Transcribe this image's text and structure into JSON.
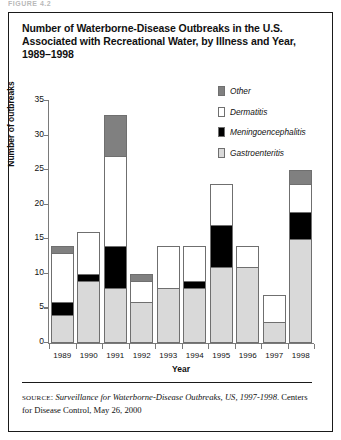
{
  "scan_header": "FIGURE 4.2",
  "figure": {
    "title": "Number of Waterborne-Disease Outbreaks in the U.S. Associated with Recreational Water, by Illness and Year, 1989–1998",
    "source_keyword": "SOURCE",
    "source_italic": "Surveillance for Waterborne-Disease Outbreaks, US, 1997-1998",
    "source_rest": ". Centers for Disease Control, May 26, 2000"
  },
  "colors": {
    "other": "#808080",
    "dermatitis": "#ffffff",
    "meningoencephalitis": "#000000",
    "gastroenteritis": "#d9d9d9",
    "outline": "#6f6f6f",
    "axis": "#7a7a7a",
    "text": "#111111",
    "frame": "#1a1a1a"
  },
  "chart_data": {
    "type": "bar",
    "stacked": true,
    "title": "Number of Waterborne-Disease Outbreaks in the U.S. Associated with Recreational Water, by Illness and Year, 1989–1998",
    "xlabel": "Year",
    "ylabel": "Number of outbreaks",
    "ylim": [
      0,
      35
    ],
    "yticks": [
      0,
      5,
      10,
      15,
      20,
      25,
      30,
      35
    ],
    "grid": false,
    "legend_position": "top-right",
    "categories": [
      "1989",
      "1990",
      "1991",
      "1992",
      "1993",
      "1994",
      "1995",
      "1996",
      "1997",
      "1998"
    ],
    "series": [
      {
        "name": "Gastroenteritis",
        "color": "#d9d9d9",
        "values": [
          4,
          9,
          8,
          6,
          8,
          8,
          11,
          11,
          3,
          15
        ]
      },
      {
        "name": "Meningoencephalitis",
        "color": "#000000",
        "values": [
          2,
          1,
          6,
          0,
          0,
          1,
          6,
          0,
          0,
          4
        ]
      },
      {
        "name": "Dermatitis",
        "color": "#ffffff",
        "values": [
          7,
          6,
          13,
          3,
          6,
          5,
          6,
          3,
          4,
          4
        ]
      },
      {
        "name": "Other",
        "color": "#808080",
        "values": [
          1,
          0,
          6,
          1,
          0,
          0,
          0,
          0,
          0,
          2
        ]
      }
    ],
    "totals": [
      14,
      16,
      33,
      10,
      14,
      14,
      23,
      14,
      7,
      25
    ]
  },
  "legend": [
    {
      "label": "Other",
      "color": "#808080"
    },
    {
      "label": "Dermatitis",
      "color": "#ffffff"
    },
    {
      "label": "Meningoencephalitis",
      "color": "#000000"
    },
    {
      "label": "Gastroenteritis",
      "color": "#d9d9d9"
    }
  ]
}
